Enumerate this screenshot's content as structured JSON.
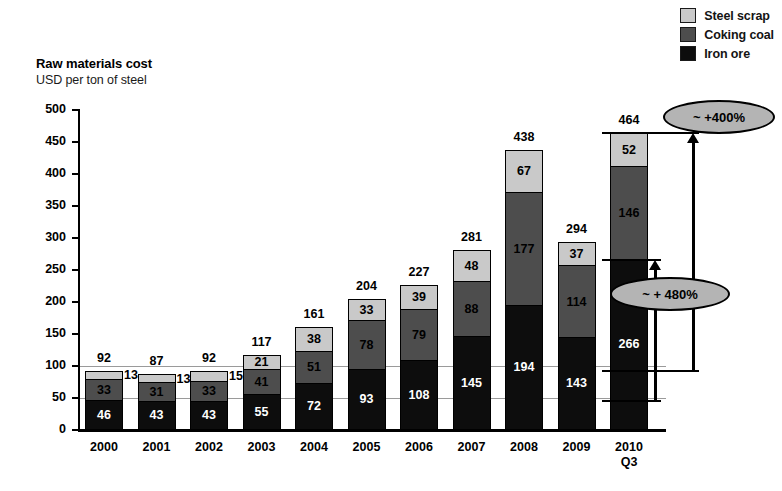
{
  "chart_data": {
    "type": "bar",
    "subtype": "stacked-bar",
    "title": "Raw materials cost",
    "subtitle": "USD per ton of steel",
    "xlabel": "",
    "ylabel": "USD per ton of steel",
    "ylim": [
      0,
      500
    ],
    "ytick_step": 50,
    "yticks": [
      0,
      50,
      100,
      150,
      200,
      250,
      300,
      350,
      400,
      450,
      500
    ],
    "ytick_labels": [
      "0",
      "50",
      "100",
      "150",
      "200",
      "250",
      "300",
      "350",
      "400",
      "450",
      "500"
    ],
    "gridlines": [
      50,
      100
    ],
    "grid": true,
    "legend_position": "top-right",
    "categories": [
      "2000",
      "2001",
      "2002",
      "2003",
      "2004",
      "2005",
      "2006",
      "2007",
      "2008",
      "2009",
      "2010"
    ],
    "category_sublabels": [
      "",
      "",
      "",
      "",
      "",
      "",
      "",
      "",
      "",
      "",
      "Q3"
    ],
    "series": [
      {
        "name": "Iron ore",
        "color": "#0d0d0d",
        "values": [
          46,
          43,
          43,
          55,
          72,
          93,
          108,
          145,
          194,
          143,
          266
        ]
      },
      {
        "name": "Coking coal",
        "color": "#4d4d4d",
        "values": [
          33,
          31,
          33,
          41,
          51,
          78,
          79,
          88,
          177,
          114,
          146
        ]
      },
      {
        "name": "Steel scrap",
        "color": "#c9c9c9",
        "values": [
          13,
          13,
          15,
          21,
          38,
          33,
          39,
          48,
          67,
          37,
          52
        ]
      }
    ],
    "totals": [
      92,
      87,
      92,
      117,
      161,
      204,
      227,
      281,
      438,
      294,
      464
    ],
    "annotations": [
      {
        "label": "~ +400%",
        "from_value": 92,
        "to_value": 464,
        "description": "total raw material cost growth 2000 to 2010 Q3"
      },
      {
        "label": "~ + 480%",
        "from_value": 46,
        "to_value": 266,
        "description": "iron ore cost growth 2000 to 2010 Q3"
      }
    ]
  },
  "legend": {
    "items": [
      {
        "label": "Steel scrap",
        "color": "#c9c9c9"
      },
      {
        "label": "Coking coal",
        "color": "#4d4d4d"
      },
      {
        "label": "Iron ore",
        "color": "#0d0d0d"
      }
    ]
  }
}
